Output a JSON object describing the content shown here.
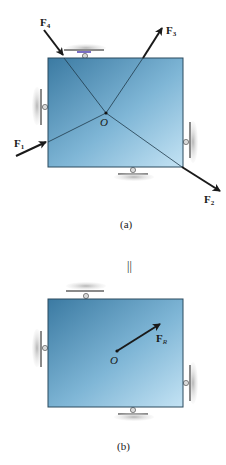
{
  "figure_a": {
    "caption": "(a)",
    "origin_label": "O",
    "forces": [
      {
        "name": "F",
        "sub": "1"
      },
      {
        "name": "F",
        "sub": "2"
      },
      {
        "name": "F",
        "sub": "3"
      },
      {
        "name": "F",
        "sub": "4"
      }
    ]
  },
  "equivalence_symbol": "||",
  "figure_b": {
    "caption": "(b)",
    "origin_label": "O",
    "resultant": {
      "name": "F",
      "sub": "R"
    }
  },
  "colors": {
    "plate_dark": "#3f7fa6",
    "plate_light": "#bfe0f2",
    "plate_border": "#2a4a5e",
    "arrow": "#1a1a1a",
    "support_ground": "#c8c8c8",
    "support_metal": "#8a8a8a",
    "support_accent": "#7a6fc4"
  }
}
